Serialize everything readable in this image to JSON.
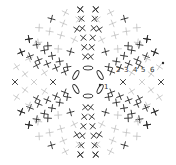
{
  "diagram": {
    "type": "crochet-chart",
    "center": [
      88,
      82
    ],
    "colors": {
      "dark": "#2a2a2a",
      "light": "#b8b8b8",
      "background": "#ffffff"
    },
    "center_ring": {
      "stitch": "chain",
      "count": 6
    },
    "wedges": 6,
    "row_labels": [
      {
        "text": "1",
        "x": 104,
        "y": 84
      },
      {
        "text": "2",
        "x": 116,
        "y": 67
      },
      {
        "text": "3",
        "x": 124,
        "y": 67
      },
      {
        "text": "4",
        "x": 133,
        "y": 67
      },
      {
        "text": "5",
        "x": 141,
        "y": 67
      },
      {
        "text": "6",
        "x": 150,
        "y": 67
      }
    ],
    "markers": [
      {
        "name": "start-dot",
        "x": 100,
        "y": 85
      },
      {
        "name": "end-dot",
        "x": 163,
        "y": 63
      }
    ]
  }
}
